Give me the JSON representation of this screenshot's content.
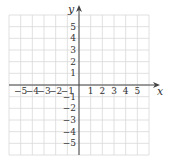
{
  "chart_data": {
    "type": "scatter",
    "title": "",
    "xlabel": "x",
    "ylabel": "y",
    "xlim": [
      -6,
      6
    ],
    "ylim": [
      -6,
      6
    ],
    "grid": true,
    "x_ticks": [
      "-5",
      "-4",
      "-3",
      "-2",
      "-1",
      "1",
      "2",
      "3",
      "4",
      "5"
    ],
    "y_ticks": [
      "5",
      "4",
      "3",
      "2",
      "1",
      "-1",
      "-2",
      "-3",
      "-4",
      "-5"
    ],
    "series": [],
    "legend": null
  },
  "axes": {
    "x_label": "x",
    "y_label": "y"
  },
  "colors": {
    "grid": "#d8d8d8",
    "axis": "#444444",
    "text": "#333333"
  }
}
